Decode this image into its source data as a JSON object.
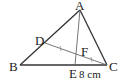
{
  "diagram": {
    "type": "triangle-geometry",
    "points": {
      "A": {
        "label": "A",
        "x": 80,
        "y": 10
      },
      "B": {
        "label": "B",
        "x": 20,
        "y": 65
      },
      "C": {
        "label": "C",
        "x": 107,
        "y": 65
      },
      "D": {
        "label": "D",
        "x": 45,
        "y": 43
      },
      "E": {
        "label": "E",
        "x": 75,
        "y": 65
      },
      "F": {
        "label": "F",
        "x": 77,
        "y": 54
      }
    },
    "segments": [
      "AB",
      "BC",
      "CA",
      "AE",
      "DC"
    ],
    "equal_marks": [
      "DF",
      "FC"
    ],
    "measurement": {
      "segment": "EC",
      "label": "8 cm"
    },
    "colors": {
      "stroke": "#333333",
      "thin_stroke": "#666666",
      "text": "#222222"
    }
  }
}
